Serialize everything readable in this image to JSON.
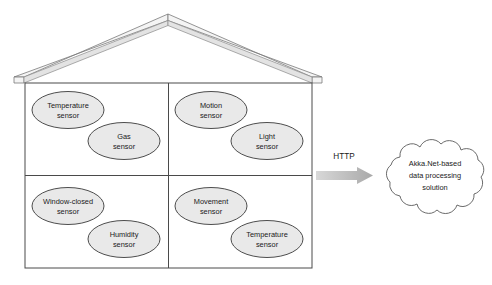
{
  "diagram": {
    "colors": {
      "ellipse_fill": "#e9e9e9",
      "ellipse_stroke": "#3a3a3a",
      "house_stroke": "#4a4a4a",
      "roof_fill": "#f2f2f2",
      "roof_stroke": "#6e6e6e",
      "arrow_fill": "#b4b4b4",
      "cloud_stroke": "#5a5a5a",
      "cloud_fill": "#ffffff",
      "text": "#1a1a1a",
      "background": "#ffffff"
    },
    "house": {
      "name": "smart-home",
      "rooms": [
        {
          "id": "room-top-left",
          "sensors": [
            {
              "id": "sensor-temperature-1",
              "line1": "Temperature",
              "line2": "sensor"
            },
            {
              "id": "sensor-gas",
              "line1": "Gas",
              "line2": "sensor"
            }
          ]
        },
        {
          "id": "room-top-right",
          "sensors": [
            {
              "id": "sensor-motion",
              "line1": "Motion",
              "line2": "sensor"
            },
            {
              "id": "sensor-light",
              "line1": "Light",
              "line2": "sensor"
            }
          ]
        },
        {
          "id": "room-bottom-left",
          "sensors": [
            {
              "id": "sensor-window-closed",
              "line1": "Window-closed",
              "line2": "sensor"
            },
            {
              "id": "sensor-humidity",
              "line1": "Humidity",
              "line2": "sensor"
            }
          ]
        },
        {
          "id": "room-bottom-right",
          "sensors": [
            {
              "id": "sensor-movement",
              "line1": "Movement",
              "line2": "sensor"
            },
            {
              "id": "sensor-temperature-2",
              "line1": "Temperature",
              "line2": "sensor"
            }
          ]
        }
      ]
    },
    "connector": {
      "label": "HTTP",
      "icon": "arrow-right-icon"
    },
    "cloud": {
      "icon": "cloud-icon",
      "line1": "Akka.Net-based",
      "line2": "data processing",
      "line3": "solution"
    }
  }
}
